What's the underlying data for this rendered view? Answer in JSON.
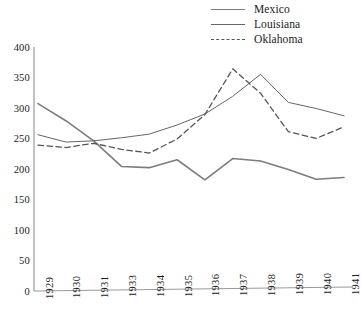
{
  "chart_data": {
    "type": "line",
    "title": "",
    "xlabel": "",
    "ylabel": "",
    "categories": [
      "1929",
      "1930",
      "1931",
      "1933",
      "1934",
      "1935",
      "1936",
      "1937",
      "1938",
      "1939",
      "1940",
      "1941"
    ],
    "ylim": [
      0,
      400
    ],
    "ytick_values": [
      0,
      50,
      100,
      150,
      200,
      250,
      300,
      350,
      400
    ],
    "ytick_labels": [
      "0",
      "50",
      "100",
      "150",
      "200",
      "250",
      "300",
      "350",
      "400"
    ],
    "grid": false,
    "legend_position": "top-right",
    "series": [
      {
        "name": "Mexico",
        "style": "solid",
        "color": "#7d7d7d",
        "width": 1.6,
        "values": [
          308,
          280,
          247,
          205,
          203,
          216,
          183,
          218,
          214,
          200,
          184,
          187
        ]
      },
      {
        "name": "Louisiana",
        "style": "solid",
        "color": "#666666",
        "width": 1.0,
        "values": [
          257,
          245,
          247,
          252,
          258,
          273,
          291,
          320,
          356,
          310,
          300,
          288
        ]
      },
      {
        "name": "Oklahoma",
        "style": "dashed",
        "color": "#555555",
        "width": 1.3,
        "values": [
          240,
          236,
          243,
          233,
          227,
          250,
          290,
          365,
          325,
          262,
          251,
          270
        ]
      }
    ]
  },
  "legend": {
    "items": [
      {
        "label": "Mexico"
      },
      {
        "label": "Louisiana"
      },
      {
        "label": "Oklahoma"
      }
    ]
  },
  "axes": {
    "y_labels": [
      "400",
      "350",
      "300",
      "250",
      "200",
      "150",
      "100",
      "50",
      "0"
    ],
    "x_labels": [
      "1929",
      "1930",
      "1931",
      "1933",
      "1934",
      "1935",
      "1936",
      "1937",
      "1938",
      "1939",
      "1940",
      "1941"
    ]
  }
}
